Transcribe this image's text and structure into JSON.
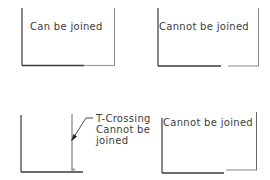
{
  "diagram": {
    "colors": {
      "line_dark": "#3a3a3a",
      "line_light": "#9a9a9a",
      "text": "#3c3c3c",
      "background": "#ffffff"
    },
    "panels": [
      {
        "id": "top-left",
        "label": "Can be joined"
      },
      {
        "id": "top-right",
        "label": "Cannot be joined"
      },
      {
        "id": "bottom-left",
        "callout": {
          "line1": "T-Crossing",
          "line2": "Cannot be",
          "line3": "joined"
        }
      },
      {
        "id": "bottom-right",
        "label": "Cannot be joined"
      }
    ]
  }
}
